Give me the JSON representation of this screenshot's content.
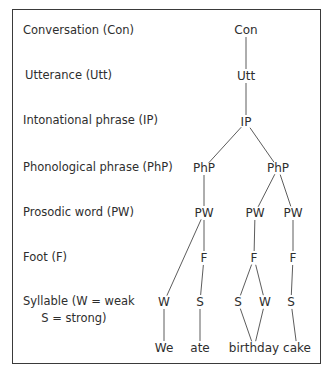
{
  "levels": [
    {
      "label": "Conversation (Con)"
    },
    {
      "label": "Utterance (Utt)"
    },
    {
      "label": "Intonational phrase (IP)"
    },
    {
      "label": "Phonological phrase (PhP)"
    },
    {
      "label": "Prosodic word (PW)"
    },
    {
      "label": "Foot (F)"
    },
    {
      "label": "Syllable (W = weak\n     S = strong)"
    }
  ],
  "tree": {
    "nodes": [
      {
        "id": "con",
        "label": "Con",
        "x": 246,
        "y": 30
      },
      {
        "id": "utt",
        "label": "Utt",
        "x": 246,
        "y": 76
      },
      {
        "id": "ip",
        "label": "IP",
        "x": 246,
        "y": 122
      },
      {
        "id": "php1",
        "label": "PhP",
        "x": 204,
        "y": 168
      },
      {
        "id": "php2",
        "label": "PhP",
        "x": 278,
        "y": 168
      },
      {
        "id": "pw1",
        "label": "PW",
        "x": 204,
        "y": 213
      },
      {
        "id": "pw2",
        "label": "PW",
        "x": 255,
        "y": 213
      },
      {
        "id": "pw3",
        "label": "PW",
        "x": 293,
        "y": 213
      },
      {
        "id": "f1",
        "label": "F",
        "x": 204,
        "y": 258
      },
      {
        "id": "f2",
        "label": "F",
        "x": 254,
        "y": 258
      },
      {
        "id": "f3",
        "label": "F",
        "x": 293,
        "y": 258
      },
      {
        "id": "syl1",
        "label": "W",
        "x": 164,
        "y": 302
      },
      {
        "id": "syl2",
        "label": "S",
        "x": 200,
        "y": 302
      },
      {
        "id": "syl3",
        "label": "S",
        "x": 238,
        "y": 302
      },
      {
        "id": "syl4",
        "label": "W",
        "x": 265,
        "y": 302
      },
      {
        "id": "syl5",
        "label": "S",
        "x": 291,
        "y": 302
      },
      {
        "id": "w1",
        "label": "We",
        "x": 164,
        "y": 348
      },
      {
        "id": "w2",
        "label": "ate",
        "x": 200,
        "y": 348
      },
      {
        "id": "w3",
        "label": "birthday",
        "x": 254,
        "y": 348
      },
      {
        "id": "w4",
        "label": "cake",
        "x": 297,
        "y": 348
      }
    ],
    "edges": [
      [
        "con",
        "utt"
      ],
      [
        "utt",
        "ip"
      ],
      [
        "ip",
        "php1"
      ],
      [
        "ip",
        "php2"
      ],
      [
        "php1",
        "pw1"
      ],
      [
        "php2",
        "pw2"
      ],
      [
        "php2",
        "pw3"
      ],
      [
        "pw1",
        "syl1"
      ],
      [
        "pw1",
        "f1"
      ],
      [
        "pw2",
        "f2"
      ],
      [
        "pw3",
        "f3"
      ],
      [
        "f1",
        "syl2"
      ],
      [
        "f2",
        "syl3"
      ],
      [
        "f2",
        "syl4"
      ],
      [
        "f3",
        "syl5"
      ],
      [
        "syl1",
        "w1"
      ],
      [
        "syl2",
        "w2"
      ],
      [
        "syl3",
        "w3"
      ],
      [
        "syl4",
        "w3"
      ],
      [
        "syl5",
        "w4"
      ]
    ]
  }
}
